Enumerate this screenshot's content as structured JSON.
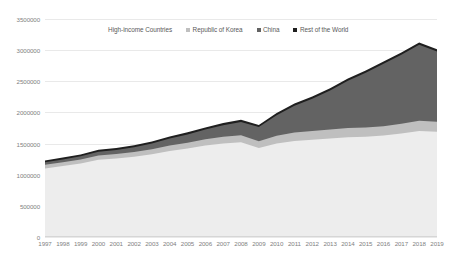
{
  "chart_data": {
    "type": "area",
    "stacked": true,
    "title": "",
    "subtitle": "",
    "xlabel": "",
    "ylabel": "",
    "categories": [
      1997,
      1998,
      1999,
      2000,
      2001,
      2002,
      2003,
      2004,
      2005,
      2006,
      2007,
      2008,
      2009,
      2010,
      2011,
      2012,
      2013,
      2014,
      2015,
      2016,
      2017,
      2018,
      2019
    ],
    "x": [
      "1997",
      "1998",
      "1999",
      "2000",
      "2001",
      "2002",
      "2003",
      "2004",
      "2005",
      "2006",
      "2007",
      "2008",
      "2009",
      "2010",
      "2011",
      "2012",
      "2013",
      "2014",
      "2015",
      "2016",
      "2017",
      "2018",
      "2019"
    ],
    "ylim": [
      0,
      3500000
    ],
    "xlim": [
      "1997",
      "2019"
    ],
    "yticks": [
      0,
      500000,
      1000000,
      1500000,
      2000000,
      2500000,
      3000000,
      3500000
    ],
    "ytick_labels": [
      "0",
      "500000",
      "1000000",
      "1500000",
      "2000000",
      "2500000",
      "3000000",
      "3500000"
    ],
    "grid": true,
    "grid_axis": "y",
    "legend_position": "top-center",
    "series": [
      {
        "name": "High-income Countries",
        "color": "#ededed",
        "values": [
          1100000,
          1140000,
          1180000,
          1240000,
          1260000,
          1290000,
          1330000,
          1380000,
          1420000,
          1470000,
          1500000,
          1520000,
          1430000,
          1500000,
          1540000,
          1560000,
          1580000,
          1600000,
          1610000,
          1630000,
          1660000,
          1700000,
          1690000
        ]
      },
      {
        "name": "Republic of Korea",
        "color": "#bfbfbf",
        "values": [
          60000,
          62000,
          66000,
          70000,
          72000,
          76000,
          80000,
          88000,
          94000,
          100000,
          108000,
          114000,
          108000,
          124000,
          136000,
          140000,
          144000,
          148000,
          148000,
          150000,
          158000,
          166000,
          160000
        ]
      },
      {
        "name": "China",
        "color": "#636363",
        "values": [
          40000,
          44000,
          50000,
          58000,
          64000,
          74000,
          90000,
          112000,
          132000,
          156000,
          186000,
          214000,
          228000,
          330000,
          430000,
          520000,
          630000,
          760000,
          880000,
          1000000,
          1110000,
          1220000,
          1130000
        ]
      },
      {
        "name": "Rest of the World",
        "color": "#1f1f1f",
        "values": [
          30000,
          30000,
          30000,
          32000,
          32000,
          32000,
          34000,
          34000,
          34000,
          34000,
          36000,
          36000,
          34000,
          36000,
          36000,
          36000,
          36000,
          36000,
          36000,
          36000,
          36000,
          38000,
          36000
        ]
      }
    ]
  },
  "legend": {
    "items": [
      {
        "label": "High-income Countries",
        "color": "#ededed"
      },
      {
        "label": "Republic of Korea",
        "color": "#bfbfbf"
      },
      {
        "label": "China",
        "color": "#636363"
      },
      {
        "label": "Rest of the World",
        "color": "#1f1f1f"
      }
    ]
  }
}
